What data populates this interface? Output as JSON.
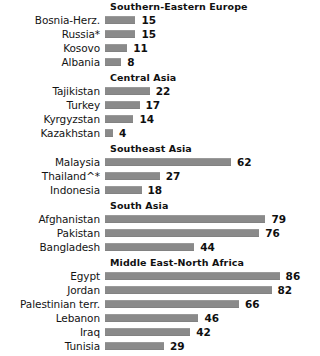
{
  "chart_data": {
    "type": "bar",
    "title": "",
    "subtitle": "",
    "xlabel": "",
    "ylabel": "",
    "orientation": "horizontal",
    "grid": false,
    "legend": null,
    "xlim": [
      0,
      100
    ],
    "axis_ticks_visible": false,
    "value_labels_shown": true,
    "bar_color": "#8a8a8a",
    "background_color": "#ffffff",
    "groups": [
      {
        "header": "Southern-Eastern  Europe",
        "categories": [
          "Bosnia-Herz.",
          "Russia*",
          "Kosovo",
          "Albania"
        ],
        "values": [
          15,
          15,
          11,
          8
        ]
      },
      {
        "header": "Central Asia",
        "categories": [
          "Tajikistan",
          "Turkey",
          "Kyrgyzstan",
          "Kazakhstan"
        ],
        "values": [
          22,
          17,
          14,
          4
        ]
      },
      {
        "header": "Southeast  Asia",
        "categories": [
          "Malaysia",
          "Thailand^*",
          "Indonesia"
        ],
        "values": [
          62,
          27,
          18
        ]
      },
      {
        "header": "South  Asia",
        "categories": [
          "Afghanistan",
          "Pakistan",
          "Bangladesh"
        ],
        "values": [
          79,
          76,
          44
        ]
      },
      {
        "header": "Middle East-North  Africa",
        "categories": [
          "Egypt",
          "Jordan",
          "Palestinian terr.",
          "Lebanon",
          "Iraq",
          "Tunisia"
        ],
        "values": [
          86,
          82,
          66,
          46,
          42,
          29
        ]
      }
    ],
    "categories": [
      "Bosnia-Herz.",
      "Russia*",
      "Kosovo",
      "Albania",
      "Tajikistan",
      "Turkey",
      "Kyrgyzstan",
      "Kazakhstan",
      "Malaysia",
      "Thailand^*",
      "Indonesia",
      "Afghanistan",
      "Pakistan",
      "Bangladesh",
      "Egypt",
      "Jordan",
      "Palestinian terr.",
      "Lebanon",
      "Iraq",
      "Tunisia"
    ],
    "values": [
      15,
      15,
      11,
      8,
      22,
      17,
      14,
      4,
      62,
      27,
      18,
      79,
      76,
      44,
      86,
      82,
      66,
      46,
      42,
      29
    ]
  }
}
